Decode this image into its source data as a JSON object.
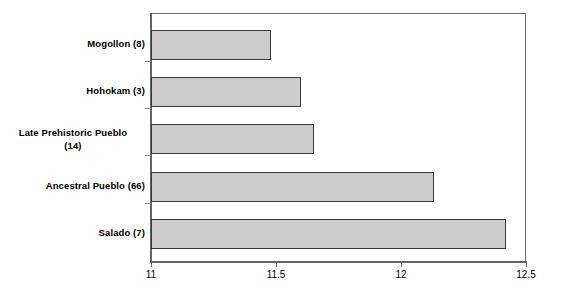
{
  "chart_data": {
    "type": "bar",
    "orientation": "horizontal",
    "title": "",
    "xlabel": "",
    "ylabel": "",
    "xlim": [
      11,
      12.5
    ],
    "xticks": [
      11,
      11.5,
      12,
      12.5
    ],
    "xtick_labels": [
      "11",
      "11.5",
      "12",
      "12.5"
    ],
    "grid": false,
    "legend": null,
    "categories": [
      "Mogollon (8)",
      "Hohokam (3)",
      "Late Prehistoric Pueblo (14)",
      "Ancestral Pueblo (66)",
      "Salado (7)"
    ],
    "values": [
      11.48,
      11.6,
      11.65,
      12.13,
      12.42
    ],
    "bar_fill_color": "#cccccc",
    "bar_border_color": "#3a3a3a",
    "axis_color": "#636363"
  },
  "bars": [
    {
      "label": "Mogollon (8)",
      "label_line1": "Mogollon (8)",
      "label_line2": "",
      "value": 11.48,
      "multiline": false
    },
    {
      "label": "Hohokam (3)",
      "label_line1": "Hohokam (3)",
      "label_line2": "",
      "value": 11.6,
      "multiline": false
    },
    {
      "label": "Late Prehistoric Pueblo (14)",
      "label_line1": "Late Prehistoric Pueblo",
      "label_line2": "(14)",
      "value": 11.65,
      "multiline": true
    },
    {
      "label": "Ancestral Pueblo (66)",
      "label_line1": "Ancestral Pueblo (66)",
      "label_line2": "",
      "value": 12.13,
      "multiline": false
    },
    {
      "label": "Salado (7)",
      "label_line1": "Salado (7)",
      "label_line2": "",
      "value": 12.42,
      "multiline": false
    }
  ],
  "xaxis": {
    "tick_labels": [
      "11",
      "11.5",
      "12",
      "12.5"
    ]
  }
}
